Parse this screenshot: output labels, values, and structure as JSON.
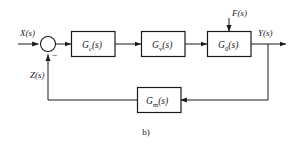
{
  "figure": {
    "caption": "b)",
    "colors": {
      "line": "#1a1a1a",
      "background": "#ffffff",
      "box_fill": "#ffffff"
    }
  },
  "signals": {
    "input": {
      "label": "X",
      "arg": "(s)"
    },
    "feedback": {
      "label": "Z",
      "arg": "(s)"
    },
    "disturbance": {
      "label": "F",
      "arg": "(s)"
    },
    "output": {
      "label": "Y",
      "arg": "(s)"
    }
  },
  "summing_junction": {
    "name": "summing-junction",
    "negative_sign": "−"
  },
  "blocks": [
    {
      "id": "controller",
      "base": "G",
      "sub": "c",
      "arg": "(s)"
    },
    {
      "id": "actuator",
      "base": "G",
      "sub": "v",
      "arg": "(s)"
    },
    {
      "id": "plant",
      "base": "G",
      "sub": "0",
      "arg": "(s)"
    },
    {
      "id": "measurement",
      "base": "G",
      "sub": "m",
      "arg": "(s)"
    }
  ]
}
